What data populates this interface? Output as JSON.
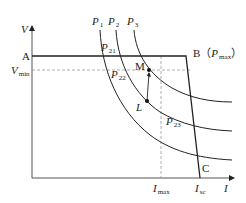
{
  "diagram": {
    "type": "PV characteristic / power curves",
    "axes": {
      "y_label": "V",
      "x_label": "I"
    },
    "points": {
      "A": "A",
      "B": "B",
      "B_note_open": "（",
      "B_note_var": "P",
      "B_note_sub": "max",
      "B_note_close": "）",
      "C": "C",
      "M": "M",
      "L": "L"
    },
    "y_ticks": {
      "vmin_var": "V",
      "vmin_sub": "min"
    },
    "x_ticks": {
      "imax_var": "I",
      "imax_sub": "max",
      "isc_var": "I",
      "isc_sub": "sc"
    },
    "curves": [
      {
        "var": "P",
        "sub": "1"
      },
      {
        "var": "P",
        "sub": "2"
      },
      {
        "var": "P",
        "sub": "3"
      }
    ],
    "intersections": [
      {
        "var": "P",
        "sub": "21"
      },
      {
        "var": "P",
        "sub": "22"
      },
      {
        "var": "P",
        "sub": "23"
      }
    ],
    "colors": {
      "line": "#222222",
      "dashed": "#9a9a9a",
      "axis": "#555555"
    }
  }
}
